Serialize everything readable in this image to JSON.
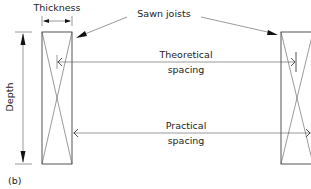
{
  "diagram": {
    "labels": {
      "thickness": "Thickness",
      "depth": "Depth",
      "sawn_joists": "Sawn joists",
      "theoretical_line1": "Theoretical",
      "theoretical_line2": "spacing",
      "practical_line1": "Practical",
      "practical_line2": "spacing",
      "figure_label": "(b)"
    },
    "colors": {
      "line": "#2a2a2a",
      "text": "#222222",
      "background": "#ffffff"
    }
  }
}
